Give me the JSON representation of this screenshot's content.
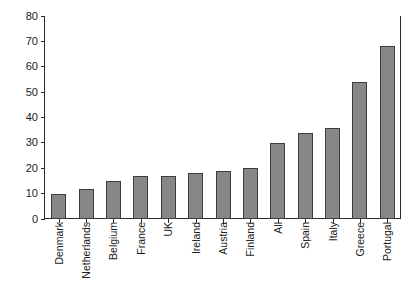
{
  "chart_data": {
    "type": "bar",
    "title": "",
    "xlabel": "",
    "ylabel": "",
    "ylim": [
      0,
      80
    ],
    "ytick_step": 10,
    "yticks": [
      80,
      70,
      60,
      50,
      40,
      30,
      20,
      10,
      0
    ],
    "grid": false,
    "legend": null,
    "categories": [
      "Denmark",
      "Netherlands",
      "Belgium",
      "France",
      "UK",
      "Ireland",
      "Austria",
      "Finland",
      "All",
      "Spain",
      "Italy",
      "Greece",
      "Portugal"
    ],
    "values": [
      10,
      12,
      15,
      17,
      17,
      18,
      19,
      20,
      30,
      34,
      36,
      54,
      68
    ],
    "bar_fill_color": "#878787",
    "bar_border_color": "#3d3d3d",
    "axis_color": "#2b2b2b"
  }
}
